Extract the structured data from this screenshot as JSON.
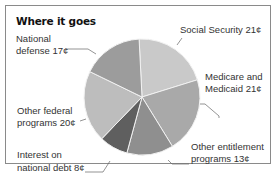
{
  "chart_data": {
    "type": "pie",
    "title": "Where it goes",
    "unit": "¢",
    "slices": [
      {
        "label": "Social Security",
        "value": 21,
        "color": "#c9c9c9"
      },
      {
        "label": "Medicare and Medicaid",
        "value": 21,
        "color": "#a9a9a9"
      },
      {
        "label": "Other entitlement programs",
        "value": 13,
        "color": "#8f8f8f"
      },
      {
        "label": "Interest on national debt",
        "value": 8,
        "color": "#5f5f5f"
      },
      {
        "label": "Other federal programs",
        "value": 20,
        "color": "#bdbdbd"
      },
      {
        "label": "National defense",
        "value": 17,
        "color": "#9c9c9c"
      }
    ]
  },
  "labels": {
    "social_security": "Social Security 21¢",
    "medicare_1": "Medicare and",
    "medicare_2": "Medicaid 21¢",
    "other_ent_1": "Other entitlement",
    "other_ent_2": "programs 13¢",
    "interest_1": "Interest on",
    "interest_2": "national debt 8¢",
    "other_fed_1": "Other federal",
    "other_fed_2": "programs 20¢",
    "defense_1": "National",
    "defense_2": "defense 17¢"
  }
}
